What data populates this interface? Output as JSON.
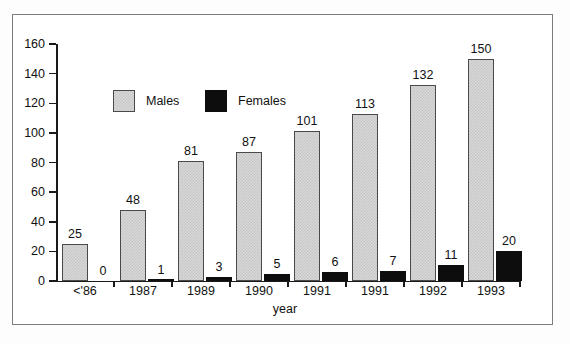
{
  "chart_data": {
    "type": "bar",
    "title": "",
    "xlabel": "year",
    "ylabel": "",
    "ylim": [
      0,
      160
    ],
    "yticks": [
      0,
      20,
      40,
      60,
      80,
      100,
      120,
      140,
      160
    ],
    "grid": false,
    "legend_position": "inside-top-left",
    "categories": [
      "<'86",
      "1987",
      "1989",
      "1990",
      "1991",
      "1991",
      "1992",
      "1993"
    ],
    "series": [
      {
        "name": "Males",
        "color": "#d8d8d8",
        "values": [
          25,
          48,
          81,
          87,
          101,
          113,
          132,
          150
        ]
      },
      {
        "name": "Females",
        "color": "#0d0d0d",
        "values": [
          0,
          1,
          3,
          5,
          6,
          7,
          11,
          20
        ]
      }
    ]
  },
  "legend": {
    "males_label": "Males",
    "females_label": "Females"
  },
  "axis": {
    "x_title": "year"
  }
}
